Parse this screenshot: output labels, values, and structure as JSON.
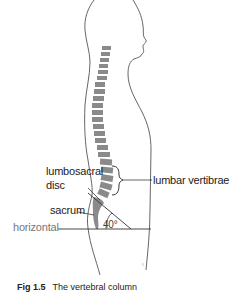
{
  "figure": {
    "caption_number": "Fig 1.5",
    "caption_text": "The vertebral column",
    "labels": {
      "lumbosacral_line1": "lumbosacral",
      "lumbosacral_line2": "disc",
      "lumbar_vertebrae": "lumbar vertibrae",
      "sacrum": "sacrum",
      "horizontal": "horizontal",
      "angle": "40°"
    },
    "colors": {
      "outline": "#555555",
      "vertebra": "#8a8a8a",
      "leader": "#333333",
      "background": "#ffffff"
    }
  }
}
